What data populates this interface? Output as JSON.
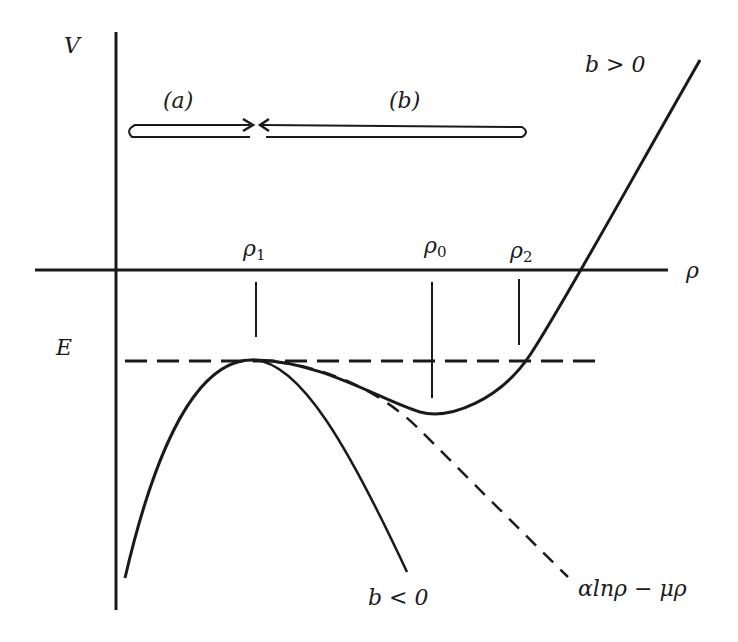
{
  "diagram": {
    "axes": {
      "y_label": "V",
      "x_label": "ρ",
      "energy_label": "E"
    },
    "points": {
      "rho1": "ρ",
      "rho1_sub": "1",
      "rho0": "ρ",
      "rho0_sub": "0",
      "rho2": "ρ",
      "rho2_sub": "2"
    },
    "regions": {
      "a": "(a)",
      "b": "(b)"
    },
    "curves": {
      "b_positive": "b > 0",
      "b_negative": "b < 0",
      "asymptote": "αlnρ − μρ"
    },
    "colors": {
      "ink": "#1a1a1a",
      "background": "#ffffff"
    }
  }
}
